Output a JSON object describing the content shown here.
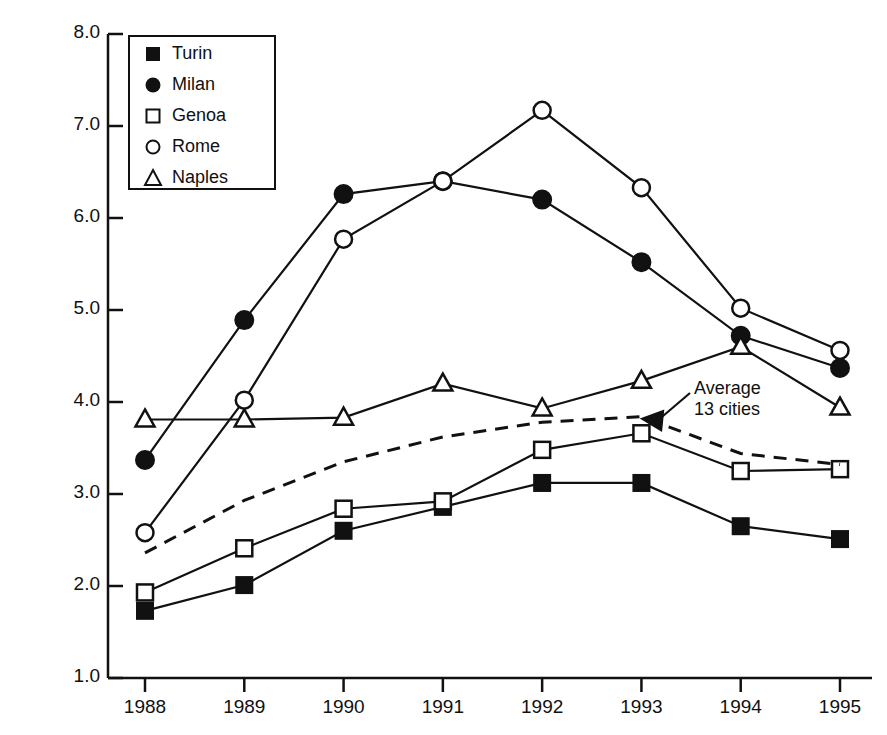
{
  "chart_data": {
    "type": "line",
    "title": "",
    "xlabel": "",
    "ylabel": "1980 lire (million) per m",
    "ylabel_sup": "2",
    "categories": [
      "1988",
      "1989",
      "1990",
      "1991",
      "1992",
      "1993",
      "1994",
      "1995"
    ],
    "x": [
      1988,
      1989,
      1990,
      1991,
      1992,
      1993,
      1994,
      1995
    ],
    "xlim": [
      1987.6,
      1995.4
    ],
    "ylim": [
      1.0,
      8.0
    ],
    "ytick_labels": [
      "1.0",
      "2.0",
      "3.0",
      "4.0",
      "5.0",
      "6.0",
      "7.0",
      "8.0"
    ],
    "yticks": [
      1.0,
      2.0,
      3.0,
      4.0,
      5.0,
      6.0,
      7.0,
      8.0
    ],
    "grid": false,
    "legend_position": "top-left-inside",
    "series": [
      {
        "name": "Turin",
        "marker": "filled-square",
        "line": "solid",
        "values": [
          1.73,
          2.01,
          2.6,
          2.86,
          3.12,
          3.12,
          2.65,
          2.51
        ]
      },
      {
        "name": "Milan",
        "marker": "filled-circle",
        "line": "solid",
        "values": [
          3.37,
          4.89,
          6.26,
          6.4,
          6.2,
          5.52,
          4.72,
          4.37
        ]
      },
      {
        "name": "Genoa",
        "marker": "open-square",
        "line": "solid",
        "values": [
          1.93,
          2.41,
          2.84,
          2.92,
          3.48,
          3.66,
          3.25,
          3.27
        ]
      },
      {
        "name": "Rome",
        "marker": "open-circle",
        "line": "solid",
        "values": [
          2.58,
          4.02,
          5.77,
          6.4,
          7.17,
          6.33,
          5.02,
          4.56
        ]
      },
      {
        "name": "Naples",
        "marker": "open-triangle",
        "line": "solid",
        "values": [
          3.81,
          3.81,
          3.83,
          4.2,
          3.93,
          4.23,
          4.6,
          3.94
        ]
      },
      {
        "name": "Average 13 cities",
        "marker": "none",
        "line": "dashed",
        "values": [
          2.36,
          2.93,
          3.35,
          3.62,
          3.78,
          3.84,
          3.44,
          3.32
        ]
      }
    ],
    "annotations": [
      {
        "text_line1": "Average",
        "text_line2": "13 cities",
        "points_to_series": "Average 13 cities",
        "points_to_x": 1993,
        "arrow": "left"
      }
    ]
  },
  "legend": {
    "items": [
      {
        "label": "Turin",
        "marker": "filled-square"
      },
      {
        "label": "Milan",
        "marker": "filled-circle"
      },
      {
        "label": "Genoa",
        "marker": "open-square"
      },
      {
        "label": "Rome",
        "marker": "open-circle"
      },
      {
        "label": "Naples",
        "marker": "open-triangle"
      }
    ]
  },
  "colors": {
    "ink": "#111111",
    "background": "#ffffff"
  }
}
